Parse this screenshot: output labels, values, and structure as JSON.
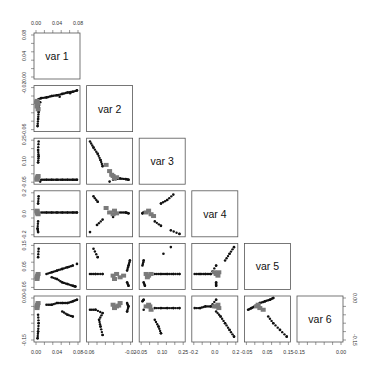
{
  "chart_data": {
    "type": "scatter",
    "subtype": "pairs-matrix-lower-triangle",
    "title": "",
    "variables": [
      "var 1",
      "var 2",
      "var 3",
      "var 4",
      "var 5",
      "var 6"
    ],
    "grid": false,
    "legend": null,
    "axes": {
      "top": {
        "panel": 0,
        "ticks": [
          "0.00",
          "0.04",
          "0.08"
        ]
      },
      "left": [
        {
          "panel": 0,
          "ticks": [
            "0.00",
            "0.04",
            "0.08"
          ]
        },
        {
          "panel": 1,
          "ticks": [
            "-0.06",
            "-0.02"
          ]
        },
        {
          "panel": 2,
          "ticks": [
            "-0.05",
            "0.10",
            "0.25"
          ]
        },
        {
          "panel": 3,
          "ticks": [
            "-0.2",
            "0.0",
            "0.2"
          ]
        },
        {
          "panel": 4,
          "ticks": [
            "-0.05",
            "0.05",
            "0.15"
          ]
        },
        {
          "panel": 5,
          "ticks": [
            "-0.15",
            "0.00"
          ]
        }
      ],
      "bottom": [
        {
          "panel": 0,
          "ticks": [
            "0.00",
            "0.04",
            "0.08"
          ]
        },
        {
          "panel": 1,
          "ticks": [
            "-0.06",
            "-0.02"
          ]
        },
        {
          "panel": 2,
          "ticks": [
            "-0.05",
            "0.10",
            "0.25"
          ]
        },
        {
          "panel": 3,
          "ticks": [
            "-0.2",
            "0.0",
            "0.2"
          ]
        },
        {
          "panel": 4,
          "ticks": [
            "-0.05",
            "0.05",
            "0.15"
          ]
        },
        {
          "panel": 5,
          "ticks": [
            "-0.15",
            "0.00"
          ]
        }
      ],
      "right": {
        "panel": 5,
        "ticks": [
          "-0.15",
          "0.00"
        ]
      }
    },
    "ranges": [
      [
        0.0,
        0.08
      ],
      [
        -0.065,
        -0.005
      ],
      [
        -0.06,
        0.28
      ],
      [
        -0.25,
        0.22
      ],
      [
        -0.08,
        0.17
      ],
      [
        -0.2,
        0.05
      ]
    ],
    "point_colors": {
      "dark": "#111111",
      "gray": "#7a7a7a"
    },
    "panels": [
      {
        "row": 1,
        "col": 0,
        "x": "var 1",
        "y": "var 2",
        "dark": [
          [
            0.004,
            -0.022
          ],
          [
            0.01,
            -0.02
          ],
          [
            0.02,
            -0.019
          ],
          [
            0.03,
            -0.017
          ],
          [
            0.04,
            -0.016
          ],
          [
            0.05,
            -0.014
          ],
          [
            0.06,
            -0.012
          ],
          [
            0.07,
            -0.011
          ],
          [
            0.078,
            -0.009
          ],
          [
            0.006,
            -0.03
          ],
          [
            0.005,
            -0.04
          ],
          [
            0.004,
            -0.05
          ],
          [
            0.003,
            -0.06
          ],
          [
            0.008,
            -0.026
          ],
          [
            0.045,
            -0.018
          ],
          [
            0.065,
            -0.013
          ]
        ],
        "gray": [
          [
            0.002,
            -0.024
          ],
          [
            0.003,
            -0.028
          ],
          [
            0.002,
            -0.032
          ],
          [
            0.004,
            -0.036
          ],
          [
            0.001,
            -0.026
          ]
        ]
      },
      {
        "row": 2,
        "col": 0,
        "x": "var 1",
        "y": "var 3",
        "dark": [
          [
            0.005,
            0.27
          ],
          [
            0.004,
            0.2
          ],
          [
            0.005,
            0.15
          ],
          [
            0.004,
            0.1
          ],
          [
            0.01,
            -0.04
          ],
          [
            0.02,
            -0.04
          ],
          [
            0.03,
            -0.04
          ],
          [
            0.04,
            -0.04
          ],
          [
            0.05,
            -0.04
          ],
          [
            0.06,
            -0.04
          ],
          [
            0.07,
            -0.04
          ],
          [
            0.078,
            -0.04
          ],
          [
            0.008,
            -0.055
          ]
        ],
        "gray": [
          [
            0.002,
            -0.03
          ],
          [
            0.003,
            -0.02
          ],
          [
            0.002,
            -0.04
          ],
          [
            0.004,
            -0.01
          ]
        ]
      },
      {
        "row": 2,
        "col": 1,
        "x": "var 2",
        "y": "var 3",
        "dark": [
          [
            -0.063,
            0.27
          ],
          [
            -0.058,
            0.22
          ],
          [
            -0.052,
            0.17
          ],
          [
            -0.048,
            0.12
          ],
          [
            -0.045,
            0.07
          ],
          [
            -0.03,
            -0.04
          ],
          [
            -0.02,
            -0.03
          ],
          [
            -0.012,
            -0.035
          ],
          [
            -0.008,
            -0.04
          ],
          [
            -0.035,
            -0.055
          ]
        ],
        "gray": [
          [
            -0.04,
            0.08
          ],
          [
            -0.035,
            0.03
          ],
          [
            -0.03,
            -0.01
          ],
          [
            -0.025,
            -0.02
          ],
          [
            -0.032,
            0.0
          ],
          [
            -0.028,
            -0.03
          ]
        ]
      },
      {
        "row": 3,
        "col": 0,
        "x": "var 1",
        "y": "var 4",
        "dark": [
          [
            0.005,
            0.18
          ],
          [
            0.004,
            0.1
          ],
          [
            0.004,
            -0.1
          ],
          [
            0.003,
            -0.18
          ],
          [
            0.004,
            -0.22
          ],
          [
            0.01,
            0.0
          ],
          [
            0.02,
            0.0
          ],
          [
            0.03,
            0.0
          ],
          [
            0.04,
            0.0
          ],
          [
            0.05,
            0.0
          ],
          [
            0.06,
            0.0
          ],
          [
            0.07,
            0.0
          ],
          [
            0.078,
            0.0
          ]
        ],
        "gray": [
          [
            0.002,
            0.01
          ],
          [
            0.003,
            -0.01
          ],
          [
            0.002,
            0.02
          ],
          [
            0.004,
            -0.02
          ]
        ]
      },
      {
        "row": 3,
        "col": 1,
        "x": "var 2",
        "y": "var 4",
        "dark": [
          [
            -0.058,
            0.18
          ],
          [
            -0.052,
            0.12
          ],
          [
            -0.045,
            -0.08
          ],
          [
            -0.053,
            -0.14
          ],
          [
            -0.063,
            -0.22
          ],
          [
            -0.02,
            0.0
          ],
          [
            -0.012,
            0.0
          ],
          [
            -0.008,
            -0.01
          ],
          [
            -0.03,
            -0.05
          ]
        ],
        "gray": [
          [
            -0.04,
            0.05
          ],
          [
            -0.035,
            0.0
          ],
          [
            -0.03,
            -0.02
          ],
          [
            -0.028,
            0.02
          ],
          [
            -0.025,
            -0.01
          ]
        ]
      },
      {
        "row": 3,
        "col": 2,
        "x": "var 3",
        "y": "var 4",
        "dark": [
          [
            0.2,
            0.2
          ],
          [
            0.15,
            0.14
          ],
          [
            0.1,
            0.1
          ],
          [
            -0.04,
            0.0
          ],
          [
            -0.05,
            -0.01
          ],
          [
            0.05,
            -0.1
          ],
          [
            0.1,
            -0.15
          ],
          [
            0.18,
            -0.2
          ],
          [
            0.25,
            -0.24
          ]
        ],
        "gray": [
          [
            0.0,
            0.02
          ],
          [
            0.02,
            -0.02
          ],
          [
            0.04,
            -0.04
          ],
          [
            -0.02,
            0.0
          ]
        ]
      },
      {
        "row": 4,
        "col": 0,
        "x": "var 1",
        "y": "var 5",
        "dark": [
          [
            0.005,
            0.15
          ],
          [
            0.004,
            0.1
          ],
          [
            0.02,
            0.0
          ],
          [
            0.03,
            0.01
          ],
          [
            0.04,
            0.02
          ],
          [
            0.05,
            0.03
          ],
          [
            0.06,
            0.04
          ],
          [
            0.07,
            0.05
          ],
          [
            0.03,
            -0.02
          ],
          [
            0.04,
            -0.03
          ],
          [
            0.05,
            -0.05
          ],
          [
            0.06,
            -0.06
          ],
          [
            0.07,
            -0.07
          ],
          [
            0.075,
            -0.075
          ],
          [
            0.078,
            0.06
          ]
        ],
        "gray": [
          [
            0.002,
            -0.02
          ],
          [
            0.003,
            -0.01
          ],
          [
            0.002,
            -0.03
          ],
          [
            0.004,
            0.0
          ]
        ]
      },
      {
        "row": 4,
        "col": 1,
        "x": "var 2",
        "y": "var 5",
        "dark": [
          [
            -0.058,
            0.15
          ],
          [
            -0.052,
            0.1
          ],
          [
            -0.063,
            0.0
          ],
          [
            -0.055,
            0.0
          ],
          [
            -0.045,
            0.0
          ],
          [
            -0.01,
            0.02
          ],
          [
            -0.008,
            0.05
          ],
          [
            -0.006,
            0.08
          ],
          [
            -0.01,
            -0.05
          ],
          [
            -0.008,
            -0.07
          ]
        ],
        "gray": [
          [
            -0.03,
            -0.01
          ],
          [
            -0.025,
            0.0
          ],
          [
            -0.02,
            -0.02
          ],
          [
            -0.028,
            -0.03
          ],
          [
            -0.015,
            -0.01
          ]
        ]
      },
      {
        "row": 4,
        "col": 2,
        "x": "var 3",
        "y": "var 5",
        "dark": [
          [
            -0.05,
            0.05
          ],
          [
            -0.04,
            0.08
          ],
          [
            -0.04,
            -0.05
          ],
          [
            -0.03,
            -0.07
          ],
          [
            0.05,
            0.0
          ],
          [
            0.1,
            0.0
          ],
          [
            0.15,
            0.0
          ],
          [
            0.2,
            0.0
          ],
          [
            0.25,
            0.0
          ],
          [
            0.12,
            0.12
          ],
          [
            0.18,
            0.16
          ]
        ],
        "gray": [
          [
            -0.02,
            0.0
          ],
          [
            0.0,
            -0.01
          ],
          [
            0.02,
            0.0
          ],
          [
            -0.01,
            -0.02
          ]
        ]
      },
      {
        "row": 4,
        "col": 3,
        "x": "var 4",
        "y": "var 5",
        "dark": [
          [
            -0.24,
            0.0
          ],
          [
            -0.18,
            0.0
          ],
          [
            -0.12,
            0.0
          ],
          [
            -0.06,
            0.0
          ],
          [
            0.0,
            0.05
          ],
          [
            0.0,
            -0.05
          ],
          [
            0.0,
            -0.07
          ],
          [
            0.1,
            0.08
          ],
          [
            0.15,
            0.12
          ],
          [
            0.2,
            0.16
          ]
        ],
        "gray": [
          [
            0.0,
            0.0
          ],
          [
            0.02,
            -0.01
          ],
          [
            -0.02,
            0.01
          ],
          [
            0.03,
            0.01
          ]
        ]
      },
      {
        "row": 5,
        "col": 0,
        "x": "var 1",
        "y": "var 6",
        "dark": [
          [
            0.004,
            -0.05
          ],
          [
            0.005,
            -0.1
          ],
          [
            0.004,
            -0.15
          ],
          [
            0.003,
            -0.19
          ],
          [
            0.02,
            0.01
          ],
          [
            0.03,
            0.01
          ],
          [
            0.04,
            0.02
          ],
          [
            0.05,
            0.02
          ],
          [
            0.06,
            0.02
          ],
          [
            0.07,
            0.03
          ],
          [
            0.078,
            0.04
          ],
          [
            0.05,
            -0.03
          ],
          [
            0.06,
            -0.05
          ],
          [
            0.07,
            -0.06
          ]
        ],
        "gray": [
          [
            0.002,
            0.0
          ],
          [
            0.003,
            0.01
          ],
          [
            0.002,
            -0.01
          ],
          [
            0.004,
            0.02
          ]
        ]
      },
      {
        "row": 5,
        "col": 1,
        "x": "var 2",
        "y": "var 6",
        "dark": [
          [
            -0.063,
            -0.02
          ],
          [
            -0.055,
            -0.02
          ],
          [
            -0.045,
            -0.04
          ],
          [
            -0.05,
            -0.08
          ],
          [
            -0.048,
            -0.12
          ],
          [
            -0.045,
            -0.17
          ],
          [
            -0.01,
            0.02
          ],
          [
            -0.008,
            0.0
          ],
          [
            -0.01,
            -0.03
          ]
        ],
        "gray": [
          [
            -0.03,
            0.01
          ],
          [
            -0.025,
            0.0
          ],
          [
            -0.02,
            0.02
          ],
          [
            -0.028,
            -0.01
          ],
          [
            -0.022,
            0.005
          ]
        ]
      },
      {
        "row": 5,
        "col": 2,
        "x": "var 3",
        "y": "var 6",
        "dark": [
          [
            -0.05,
            0.03
          ],
          [
            -0.04,
            0.04
          ],
          [
            -0.04,
            -0.02
          ],
          [
            0.05,
            -0.01
          ],
          [
            0.1,
            -0.01
          ],
          [
            0.15,
            -0.01
          ],
          [
            0.2,
            -0.01
          ],
          [
            0.25,
            -0.01
          ],
          [
            0.05,
            -0.08
          ],
          [
            0.08,
            -0.12
          ],
          [
            0.1,
            -0.16
          ]
        ],
        "gray": [
          [
            -0.02,
            0.0
          ],
          [
            0.0,
            0.01
          ],
          [
            0.02,
            -0.02
          ],
          [
            0.01,
            0.0
          ]
        ]
      },
      {
        "row": 5,
        "col": 3,
        "x": "var 4",
        "y": "var 6",
        "dark": [
          [
            -0.24,
            -0.01
          ],
          [
            -0.18,
            -0.01
          ],
          [
            -0.12,
            0.0
          ],
          [
            -0.06,
            0.0
          ],
          [
            0.0,
            0.04
          ],
          [
            0.0,
            -0.03
          ],
          [
            0.05,
            -0.06
          ],
          [
            0.1,
            -0.1
          ],
          [
            0.15,
            -0.14
          ],
          [
            0.2,
            -0.18
          ]
        ],
        "gray": [
          [
            0.0,
            0.0
          ],
          [
            0.02,
            0.01
          ],
          [
            -0.02,
            0.0
          ],
          [
            0.03,
            -0.01
          ]
        ]
      },
      {
        "row": 5,
        "col": 4,
        "x": "var 5",
        "y": "var 6",
        "dark": [
          [
            -0.07,
            -0.02
          ],
          [
            -0.05,
            -0.01
          ],
          [
            -0.03,
            0.0
          ],
          [
            0.0,
            0.02
          ],
          [
            0.03,
            0.03
          ],
          [
            0.06,
            0.04
          ],
          [
            0.08,
            0.05
          ],
          [
            0.05,
            -0.06
          ],
          [
            0.08,
            -0.1
          ],
          [
            0.12,
            -0.14
          ],
          [
            0.16,
            -0.18
          ]
        ],
        "gray": [
          [
            -0.02,
            0.0
          ],
          [
            0.0,
            -0.01
          ],
          [
            0.02,
            -0.02
          ],
          [
            -0.01,
            0.01
          ]
        ]
      }
    ]
  }
}
